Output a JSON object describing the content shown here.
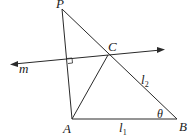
{
  "diagram": {
    "points": {
      "P": {
        "label": "P",
        "x": 62,
        "y": 9
      },
      "C": {
        "label": "C",
        "x": 108,
        "y": 55
      },
      "A": {
        "label": "A",
        "x": 72,
        "y": 119
      },
      "B": {
        "label": "B",
        "x": 177,
        "y": 119
      }
    },
    "line_m": {
      "label": "m",
      "from": [
        10,
        64
      ],
      "to": [
        165,
        49
      ]
    },
    "segments": [
      {
        "name": "PA",
        "from": "P",
        "to": "A"
      },
      {
        "name": "PB",
        "from": "P",
        "to": "B"
      },
      {
        "name": "AB",
        "from": "A",
        "to": "B"
      },
      {
        "name": "AC",
        "from": "A",
        "to": "C"
      }
    ],
    "labels": {
      "l1": "l",
      "l1_sub": "1",
      "l2": "l",
      "l2_sub": "2",
      "theta": "θ",
      "m": "m"
    },
    "right_angle_marker": {
      "at": "intersection of PA and m"
    },
    "stroke_color": "#2a2a2a",
    "caption_partial": "...in design to line segments l1 and l2..."
  }
}
